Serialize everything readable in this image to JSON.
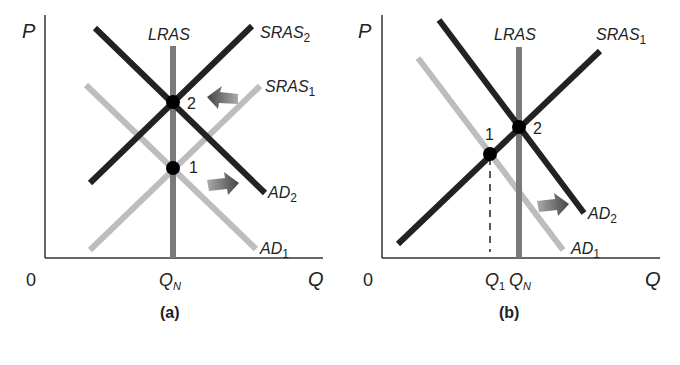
{
  "colors": {
    "dark_line": "#222222",
    "light_line": "#bdbdbd",
    "lras_line": "#7a7a7a",
    "axis": "#333333",
    "arrow": "#555555",
    "point": "#000000"
  },
  "panel_a": {
    "caption": "(a)",
    "y_axis_label": "P",
    "x_axis_label": "Q",
    "origin_label": "0",
    "lras_label": "LRAS",
    "qn_label": "Q",
    "qn_sub": "N",
    "sras2_label": "SRAS",
    "sras2_sub": "2",
    "sras1_label": "SRAS",
    "sras1_sub": "1",
    "ad2_label": "AD",
    "ad2_sub": "2",
    "ad1_label": "AD",
    "ad1_sub": "1",
    "point1_label": "1",
    "point2_label": "2"
  },
  "panel_b": {
    "caption": "(b)",
    "y_axis_label": "P",
    "x_axis_label": "Q",
    "origin_label": "0",
    "lras_label": "LRAS",
    "q1_label": "Q",
    "q1_sub": "1",
    "qn_label": "Q",
    "qn_sub": "N",
    "sras1_label": "SRAS",
    "sras1_sub": "1",
    "ad2_label": "AD",
    "ad2_sub": "2",
    "ad1_label": "AD",
    "ad1_sub": "1",
    "point1_label": "1",
    "point2_label": "2"
  }
}
